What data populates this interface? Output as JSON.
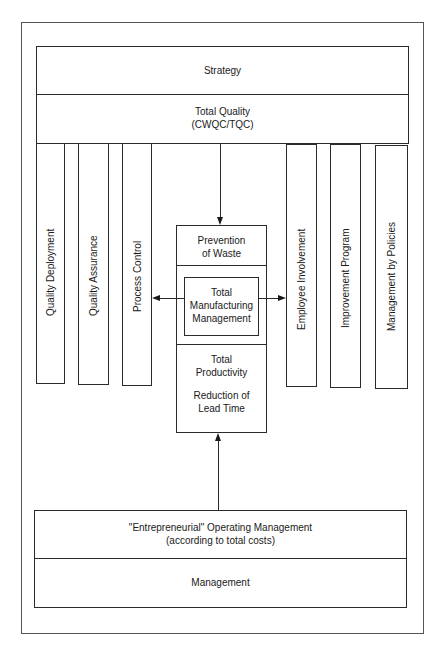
{
  "diagram": {
    "top": {
      "strategy": "Strategy",
      "total_quality": "Total Quality\n(CWQC/TQC)"
    },
    "left_columns": [
      {
        "label": "Quality Deployment"
      },
      {
        "label": "Quality Assurance"
      },
      {
        "label": "Process Control"
      }
    ],
    "right_columns": [
      {
        "label": "Employee Involvement"
      },
      {
        "label": "Improvement Program"
      },
      {
        "label": "Management by Policies"
      }
    ],
    "center": {
      "prevention": "Prevention\nof Waste",
      "core": "Total\nManufacturing\nManagement",
      "productivity": "Total\nProductivity",
      "lead_time": "Reduction of\nLead Time"
    },
    "bottom": {
      "operating": "\"Entrepreneurial\" Operating Management\n(according to total costs)",
      "management": "Management"
    },
    "colors": {
      "line": "#2a2a2a",
      "frame": "#555555",
      "background": "#ffffff"
    }
  }
}
